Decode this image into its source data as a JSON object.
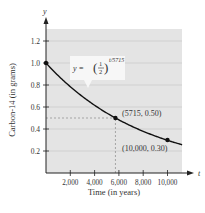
{
  "chart_data": {
    "type": "line",
    "title": "",
    "xlabel": "Time (in years)",
    "ylabel": "Carbon-14 (in grams)",
    "x_axis_var": "t",
    "y_axis_var": "y",
    "xlim": [
      0,
      11000
    ],
    "ylim": [
      0,
      1.3
    ],
    "x_ticks": [
      2000,
      4000,
      6000,
      8000,
      10000
    ],
    "x_tick_labels": [
      "2,000",
      "4,000",
      "6,000",
      "8,000",
      "10,000"
    ],
    "y_ticks": [
      0.2,
      0.4,
      0.6,
      0.8,
      1.0,
      1.2
    ],
    "y_tick_labels": [
      "0.2",
      "0.4",
      "0.6",
      "0.8",
      "1.0",
      "1.2"
    ],
    "grid": true,
    "series": [
      {
        "name": "y = (1/2)^(t/5715)",
        "function": "y = (1/2)^(t/5715)",
        "x": [
          0,
          1000,
          2000,
          3000,
          4000,
          5000,
          5715,
          6000,
          7000,
          8000,
          9000,
          10000,
          11000
        ],
        "values": [
          1.0,
          0.886,
          0.785,
          0.695,
          0.616,
          0.545,
          0.5,
          0.483,
          0.428,
          0.379,
          0.335,
          0.3,
          0.263
        ]
      }
    ],
    "points": [
      {
        "x": 0,
        "y": 1.0,
        "label": ""
      },
      {
        "x": 5715,
        "y": 0.5,
        "label": "(5715, 0.50)"
      },
      {
        "x": 10000,
        "y": 0.3,
        "label": "(10,000, 0.30)"
      }
    ],
    "annotations": [
      {
        "text": "y = (1/2)^(t/5715)",
        "target": "curve"
      },
      {
        "text": "(5715, 0.50)",
        "target": "point",
        "x": 5715,
        "y": 0.5
      },
      {
        "text": "(10,000, 0.30)",
        "target": "point",
        "x": 10000,
        "y": 0.3
      }
    ],
    "guide_lines": [
      {
        "type": "dashed",
        "from": [
          0,
          0.5
        ],
        "to": [
          5715,
          0.5
        ]
      },
      {
        "type": "dashed",
        "from": [
          5715,
          0
        ],
        "to": [
          5715,
          0.5
        ]
      }
    ]
  },
  "labels": {
    "y_var": "y",
    "x_var": "t",
    "ylabel": "Carbon-14 (in grams)",
    "xlabel": "Time (in years)",
    "eq_prefix": "y = ",
    "eq_num": "1",
    "eq_den": "2",
    "eq_exp": "t/5715",
    "pt1": "(5715, 0.50)",
    "pt2": "(10,000, 0.30)"
  },
  "colors": {
    "plot_bg": "#e4e4e4",
    "grid": "#c9c9c9",
    "curve": "#111111",
    "guide": "#8a8a8a",
    "label_box": "#f7f7f7"
  }
}
